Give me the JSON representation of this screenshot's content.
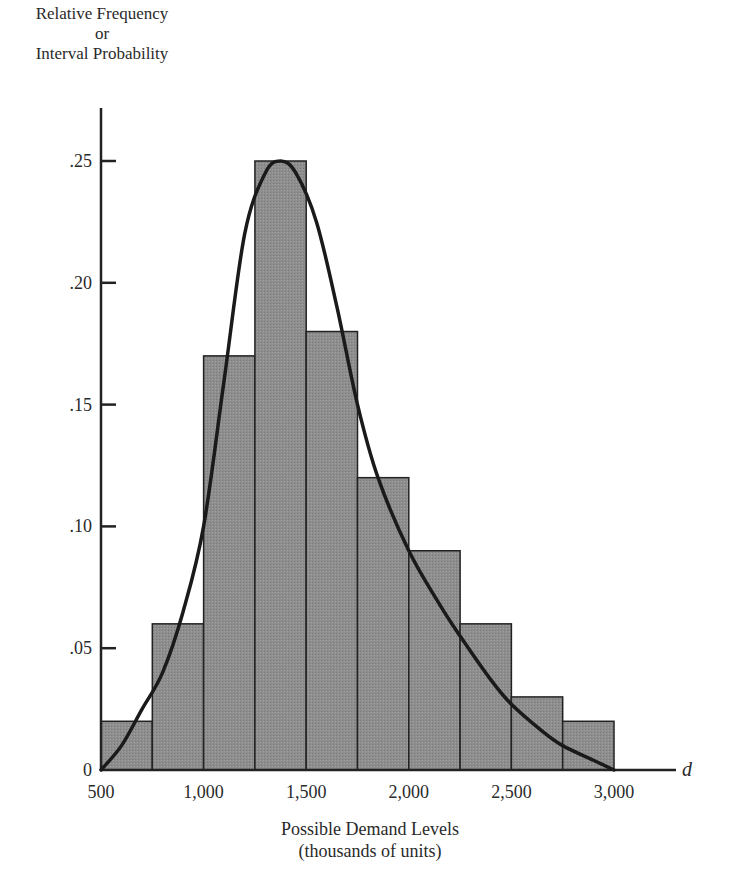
{
  "chart_data": {
    "type": "bar",
    "title": "",
    "ylabel_lines": [
      "Relative Frequency",
      "or",
      "Interval Probability"
    ],
    "xlabel_lines": [
      "Possible Demand Levels",
      "(thousands of units)"
    ],
    "x_axis_symbol": "d",
    "bin_edges": [
      500,
      750,
      1000,
      1250,
      1500,
      1750,
      2000,
      2250,
      2500,
      2750,
      3000
    ],
    "categories": [
      "500-750",
      "750-1,000",
      "1,000-1,250",
      "1,250-1,500",
      "1,500-1,750",
      "1,750-2,000",
      "2,000-2,250",
      "2,250-2,500",
      "2,500-2,750",
      "2,750-3,000"
    ],
    "values": [
      0.02,
      0.06,
      0.17,
      0.25,
      0.18,
      0.12,
      0.09,
      0.06,
      0.03,
      0.02
    ],
    "overlay_curve": {
      "name": "smooth probability density (right-skewed)",
      "points": [
        [
          500,
          0
        ],
        [
          600,
          0.01
        ],
        [
          700,
          0.025
        ],
        [
          800,
          0.04
        ],
        [
          900,
          0.065
        ],
        [
          1000,
          0.1
        ],
        [
          1100,
          0.16
        ],
        [
          1200,
          0.22
        ],
        [
          1300,
          0.245
        ],
        [
          1375,
          0.25
        ],
        [
          1450,
          0.245
        ],
        [
          1550,
          0.225
        ],
        [
          1650,
          0.19
        ],
        [
          1750,
          0.15
        ],
        [
          1850,
          0.12
        ],
        [
          2000,
          0.09
        ],
        [
          2150,
          0.068
        ],
        [
          2250,
          0.055
        ],
        [
          2400,
          0.037
        ],
        [
          2500,
          0.027
        ],
        [
          2650,
          0.016
        ],
        [
          2750,
          0.01
        ],
        [
          2900,
          0.004
        ],
        [
          3000,
          0
        ]
      ]
    },
    "x_ticks": [
      500,
      1000,
      1500,
      2000,
      2500,
      3000
    ],
    "x_tick_labels": [
      "500",
      "1,000",
      "1,500",
      "2,000",
      "2,500",
      "3,000"
    ],
    "y_ticks": [
      0,
      0.05,
      0.1,
      0.15,
      0.2,
      0.25
    ],
    "y_tick_labels": [
      "0",
      ".05",
      ".10",
      ".15",
      ".20",
      ".25"
    ],
    "xlim": [
      500,
      3300
    ],
    "ylim": [
      0,
      0.27
    ],
    "grid": false,
    "legend": null,
    "colors": {
      "bar_fill": "#8c8c8c",
      "bar_edge": "#222222",
      "curve": "#1a1a1a",
      "axis": "#222222"
    }
  },
  "labels": {
    "y_line1": "Relative Frequency",
    "y_line2": "or",
    "y_line3": "Interval Probability",
    "x_line1": "Possible Demand Levels",
    "x_line2": "(thousands of units)",
    "d": "d"
  }
}
